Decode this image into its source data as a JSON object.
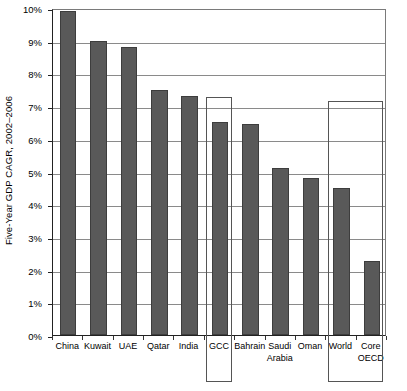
{
  "chart_data": {
    "type": "bar",
    "title": "",
    "xlabel": "",
    "ylabel": "Five-Year GDP CAGR, 2002–2006",
    "ylim": [
      0,
      10
    ],
    "y_unit": "%",
    "grid": true,
    "legend": "none",
    "categories": [
      "China",
      "Kuwait",
      "UAE",
      "Qatar",
      "India",
      "GCC",
      "Bahrain",
      "Saudi\nArabia",
      "Oman",
      "World",
      "Core\nOECD"
    ],
    "values": [
      9.9,
      9.0,
      8.8,
      7.5,
      7.3,
      6.5,
      6.45,
      5.1,
      4.8,
      4.5,
      2.25
    ],
    "ytick_labels": [
      "0%",
      "1%",
      "2%",
      "3%",
      "4%",
      "5%",
      "6%",
      "7%",
      "8%",
      "9%",
      "10%"
    ],
    "ytick_values": [
      0,
      1,
      2,
      3,
      4,
      5,
      6,
      7,
      8,
      9,
      10
    ],
    "series_color": "#595959",
    "annotations": [
      {
        "name": "gcc-highlight-box",
        "label": "GCC",
        "covers": [
          "GCC"
        ],
        "top_value": 7.3
      },
      {
        "name": "benchmark-highlight-box",
        "label": "World / Core OECD",
        "covers": [
          "World",
          "Core OECD"
        ],
        "top_value": 7.2
      }
    ]
  },
  "axis": {
    "y_title": "Five-Year GDP CAGR, 2002–2006"
  }
}
